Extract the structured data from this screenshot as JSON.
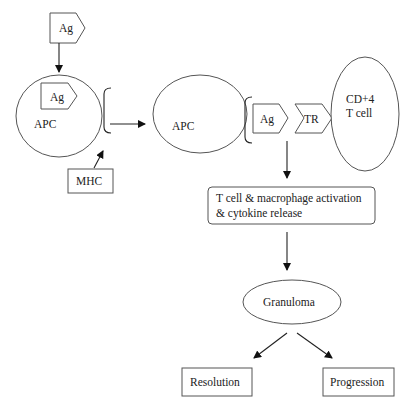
{
  "diagram": {
    "nodes": {
      "antigen_top": {
        "label": "Ag",
        "shape": "pentagon"
      },
      "apc_left": {
        "label": "APC",
        "shape": "circle"
      },
      "antigen_inner": {
        "label": "Ag",
        "shape": "pentagon"
      },
      "mhc": {
        "label": "MHC",
        "shape": "rectangle"
      },
      "apc_right": {
        "label": "APC",
        "shape": "circle"
      },
      "antigen_presented": {
        "label": "Ag",
        "shape": "pentagon"
      },
      "tcr": {
        "label": "TR",
        "shape": "chevron"
      },
      "cd4_line1": {
        "label": "CD+4"
      },
      "cd4_line2": {
        "label": "T cell"
      },
      "activation_line1": {
        "label": "T cell & macrophage activation"
      },
      "activation_line2": {
        "label": "& cytokine release"
      },
      "granuloma": {
        "label": "Granuloma",
        "shape": "ellipse"
      },
      "resolution": {
        "label": "Resolution",
        "shape": "rectangle"
      },
      "progression": {
        "label": "Progression",
        "shape": "rectangle"
      }
    },
    "edges": [
      {
        "from": "Ag",
        "to": "APC"
      },
      {
        "from": "MHC",
        "to": "APC (MHC bracket)"
      },
      {
        "from": "APC (left)",
        "to": "APC (right)"
      },
      {
        "from": "Ag-TR complex",
        "to": "T cell & macrophage activation & cytokine release"
      },
      {
        "from": "T cell & macrophage activation & cytokine release",
        "to": "Granuloma"
      },
      {
        "from": "Granuloma",
        "to": "Resolution"
      },
      {
        "from": "Granuloma",
        "to": "Progression"
      }
    ],
    "colors": {
      "stroke": "#555555",
      "text": "#222222",
      "background": "#ffffff"
    }
  }
}
